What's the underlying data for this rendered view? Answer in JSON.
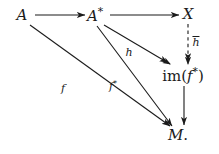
{
  "figure": {
    "type": "commutative-diagram",
    "background_color": "#ffffff",
    "ink_color": "#1b1b1b",
    "caption": ""
  },
  "nodes": [
    {
      "id": "A",
      "label": "A",
      "x": 22,
      "y": 15
    },
    {
      "id": "Astar",
      "label": "A",
      "sup": "*",
      "x": 95,
      "y": 15
    },
    {
      "id": "X",
      "label": "X",
      "x": 188,
      "y": 14
    },
    {
      "id": "imf",
      "label": "im(",
      "inner": "f",
      "sup": "*",
      "close": ")",
      "x": 183,
      "y": 75
    },
    {
      "id": "M",
      "label": "M",
      "period": ".",
      "x": 178,
      "y": 135
    }
  ],
  "edges": [
    {
      "id": "A-to-Astar",
      "from": "A",
      "to": "Astar",
      "style": "solid",
      "head": "single",
      "label": "",
      "x1": 35,
      "y1": 15,
      "x2": 85,
      "y2": 15
    },
    {
      "id": "Astar-to-X",
      "from": "Astar",
      "to": "X",
      "style": "solid",
      "head": "single",
      "label": "",
      "x1": 110,
      "y1": 15,
      "x2": 179,
      "y2": 15
    },
    {
      "id": "X-to-imf",
      "from": "X",
      "to": "imf",
      "style": "dashed",
      "head": "double",
      "label": "h",
      "label_overbar": true,
      "label_x": 196,
      "label_y": 42,
      "x1": 188,
      "y1": 24,
      "x2": 188,
      "y2": 64
    },
    {
      "id": "Astar-to-imf",
      "from": "Astar",
      "to": "imf",
      "style": "solid",
      "head": "double",
      "label": "h",
      "label_overbar": false,
      "label_x": 129,
      "label_y": 52,
      "x1": 104,
      "y1": 25,
      "x2": 170,
      "y2": 64
    },
    {
      "id": "A-to-M",
      "from": "A",
      "to": "M",
      "style": "solid",
      "head": "single",
      "label": "f",
      "label_overbar": false,
      "label_x": 63,
      "label_y": 88,
      "x1": 30,
      "y1": 25,
      "x2": 170,
      "y2": 126
    },
    {
      "id": "Astar-to-M",
      "from": "Astar",
      "to": "M",
      "style": "solid",
      "head": "single",
      "label": "f",
      "label_sup": "*",
      "label_overbar": false,
      "label_x": 113,
      "label_y": 86,
      "x1": 97,
      "y1": 26,
      "x2": 172,
      "y2": 126
    },
    {
      "id": "imf-to-M",
      "from": "imf",
      "to": "M",
      "style": "solid",
      "head": "single",
      "label": "",
      "x1": 184,
      "y1": 86,
      "x2": 184,
      "y2": 125
    }
  ]
}
